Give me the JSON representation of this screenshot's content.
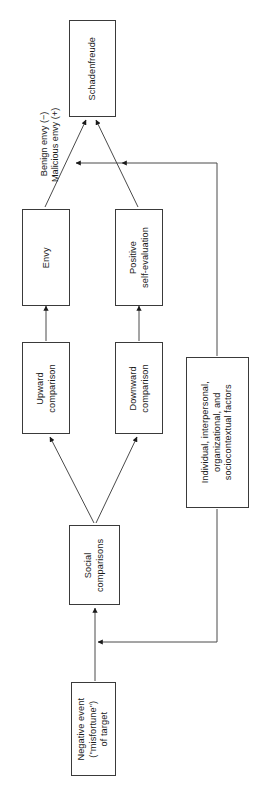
{
  "diagram": {
    "orientation": "rotated-90-ccw",
    "stroke_color": "#3a3a3a",
    "text_color": "#1a1a1a",
    "background": "#ffffff",
    "nodes": [
      {
        "id": "schadenfreude",
        "label": "Schadenfreude"
      },
      {
        "id": "envy",
        "label": "Envy"
      },
      {
        "id": "positive_self_evaluation",
        "label": "Positive\nself-evaluation"
      },
      {
        "id": "upward_comparison",
        "label": "Upward\ncomparison"
      },
      {
        "id": "downward_comparison",
        "label": "Downward\ncomparison"
      },
      {
        "id": "social_comparisons",
        "label": "Social\ncomparisons"
      },
      {
        "id": "negative_event",
        "label": "Negative event\n(\"misfortune\")\nof target"
      },
      {
        "id": "moderators",
        "label": "Individual, interpersonal,\norganizational, and\nsociocontextual factors"
      }
    ],
    "edge_labels": [
      {
        "id": "envy_valence",
        "line1": "Benign envy (−)",
        "line2": "Malicious envy (+)"
      }
    ],
    "edges": [
      {
        "from": "envy",
        "to": "schadenfreude",
        "label_id": "envy_valence"
      },
      {
        "from": "positive_self_evaluation",
        "to": "schadenfreude"
      },
      {
        "from": "upward_comparison",
        "to": "envy"
      },
      {
        "from": "downward_comparison",
        "to": "positive_self_evaluation"
      },
      {
        "from": "social_comparisons",
        "to": "upward_comparison"
      },
      {
        "from": "social_comparisons",
        "to": "downward_comparison"
      },
      {
        "from": "negative_event",
        "to": "social_comparisons"
      },
      {
        "from": "moderators",
        "to": "envy_link"
      },
      {
        "from": "moderators",
        "to": "positive_self_evaluation_link"
      },
      {
        "from": "moderators",
        "to": "negative_event_link"
      }
    ]
  }
}
